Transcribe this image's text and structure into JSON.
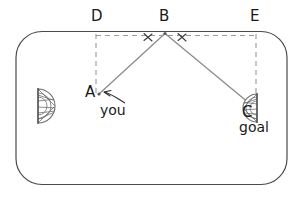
{
  "diagram": {
    "surface": {
      "shape": "rounded-rectangle",
      "name": "table"
    },
    "colors": {
      "border": "#4a4a4a",
      "ray": "#8a8a8a",
      "dashed": "#9a9a9a",
      "text": "#1a1a1a",
      "goal_fill": "#ffffff",
      "goal_stroke": "#6e6e6e"
    },
    "points": [
      {
        "id": "D",
        "label": "D",
        "x": 96,
        "y": 33,
        "label_x": 91,
        "label_y": 10
      },
      {
        "id": "B",
        "label": "B",
        "x": 165,
        "y": 33,
        "label_x": 160,
        "label_y": 10
      },
      {
        "id": "E",
        "label": "E",
        "x": 256,
        "y": 33,
        "label_x": 251,
        "label_y": 10
      },
      {
        "id": "A",
        "label": "A",
        "x": 100,
        "y": 94,
        "label_x": 86,
        "label_y": 86
      },
      {
        "id": "C",
        "label": "C",
        "x": 254,
        "y": 108,
        "label_x": 243,
        "label_y": 107
      }
    ],
    "rays": [
      {
        "name": "ray-b-to-a",
        "from": "B",
        "to": "A"
      },
      {
        "name": "ray-b-to-c",
        "from": "B",
        "to": "C"
      }
    ],
    "dashed_segments": [
      {
        "name": "dashed-rail-d-to-e",
        "orientation": "horizontal"
      },
      {
        "name": "dashed-d-to-a",
        "orientation": "vertical"
      },
      {
        "name": "dashed-e-to-c",
        "orientation": "vertical"
      }
    ],
    "angle_marks": [
      {
        "name": "angle-mark-left",
        "at": "B",
        "side": "left"
      },
      {
        "name": "angle-mark-right",
        "at": "B",
        "side": "right"
      }
    ],
    "goals": [
      {
        "name": "goal-left",
        "side": "left",
        "label": ""
      },
      {
        "name": "goal-right",
        "side": "right",
        "label": "goal"
      }
    ],
    "annotations": {
      "you": {
        "text": "you",
        "x": 100,
        "y": 104,
        "target": "A"
      },
      "goal": {
        "text": "goal",
        "x": 239,
        "y": 120,
        "target": "C"
      }
    }
  }
}
